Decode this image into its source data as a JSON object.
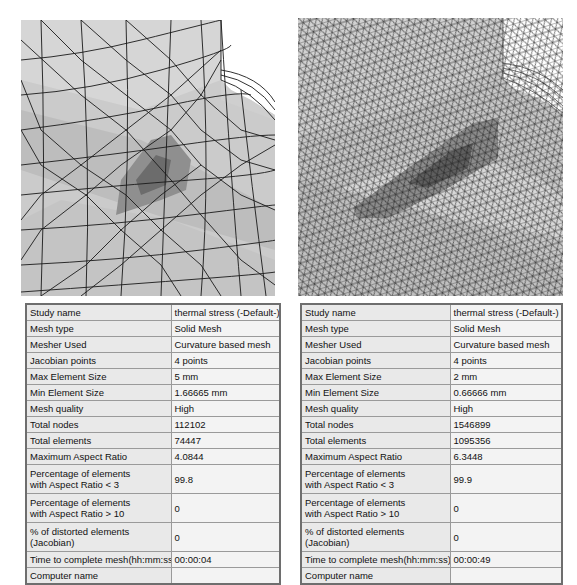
{
  "views": [
    {
      "id": "coarse",
      "mesh_label": "coarse-mesh-view",
      "colors": {
        "surface": "#c9c9c9",
        "highlight": "#e2e2e2",
        "stress_mid": "#8d8d8d",
        "stress_high": "#666666",
        "edge": "#1a1a1a"
      },
      "table": {
        "rows": [
          {
            "label": "Study name",
            "value": "thermal stress (-Default-)"
          },
          {
            "label": "Mesh type",
            "value": "Solid Mesh"
          },
          {
            "label": "Mesher Used",
            "value": "Curvature based mesh"
          },
          {
            "label": "Jacobian points",
            "value": "4 points"
          },
          {
            "label": "Max Element Size",
            "value": "5 mm"
          },
          {
            "label": "Min Element Size",
            "value": "1.66665 mm"
          },
          {
            "label": "Mesh quality",
            "value": "High"
          },
          {
            "label": "Total nodes",
            "value": "112102"
          },
          {
            "label": "Total elements",
            "value": "74447"
          },
          {
            "label": "Maximum Aspect Ratio",
            "value": "4.0844"
          },
          {
            "label_line1": "Percentage of elements",
            "label_line2": "with Aspect Ratio < 3",
            "value": "99.8"
          },
          {
            "label_line1": "Percentage of elements",
            "label_line2": "with Aspect Ratio > 10",
            "value": "0"
          },
          {
            "label_line1": "% of distorted elements",
            "label_line2": "(Jacobian)",
            "value": "0"
          },
          {
            "label": "Time to complete mesh(hh:mm:ss)",
            "value": "00:00:04"
          },
          {
            "label": "Computer name",
            "value": ""
          }
        ]
      }
    },
    {
      "id": "fine",
      "mesh_label": "fine-mesh-view",
      "colors": {
        "surface": "#c6c6c6",
        "highlight": "#dedede",
        "stress_mid": "#8a8a8a",
        "stress_high": "#5e5e5e",
        "edge": "#1a1a1a"
      },
      "table": {
        "rows": [
          {
            "label": "Study name",
            "value": "thermal stress (-Default-)"
          },
          {
            "label": "Mesh type",
            "value": "Solid Mesh"
          },
          {
            "label": "Mesher Used",
            "value": "Curvature based mesh"
          },
          {
            "label": "Jacobian points",
            "value": "4 points"
          },
          {
            "label": "Max Element Size",
            "value": "2 mm"
          },
          {
            "label": "Min Element Size",
            "value": "0.66666 mm"
          },
          {
            "label": "Mesh quality",
            "value": "High"
          },
          {
            "label": "Total nodes",
            "value": "1546899"
          },
          {
            "label": "Total elements",
            "value": "1095356"
          },
          {
            "label": "Maximum Aspect Ratio",
            "value": "6.3448"
          },
          {
            "label_line1": "Percentage of elements",
            "label_line2": "with Aspect Ratio < 3",
            "value": "99.9"
          },
          {
            "label_line1": "Percentage of elements",
            "label_line2": "with Aspect Ratio > 10",
            "value": "0"
          },
          {
            "label_line1": "% of distorted elements",
            "label_line2": "(Jacobian)",
            "value": "0"
          },
          {
            "label": "Time to complete mesh(hh:mm:ss)",
            "value": "00:00:49"
          },
          {
            "label": "Computer name",
            "value": ""
          }
        ]
      }
    }
  ]
}
